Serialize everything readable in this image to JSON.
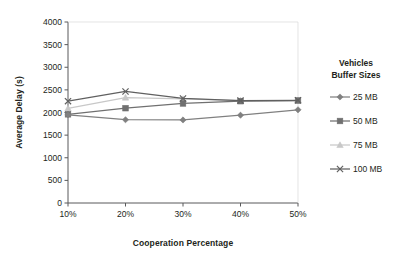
{
  "chart_data": {
    "type": "line",
    "title": "",
    "xlabel": "Cooperation Percentage",
    "ylabel": "Average Delay (s)",
    "categories": [
      "10%",
      "20%",
      "30%",
      "40%",
      "50%"
    ],
    "x_tick_labels": [
      "10%",
      "20%",
      "30%",
      "40%",
      "50%"
    ],
    "y_tick_labels": [
      "0",
      "500",
      "1000",
      "1500",
      "2000",
      "2500",
      "3000",
      "3500",
      "4000"
    ],
    "y_ticks": [
      0,
      500,
      1000,
      1500,
      2000,
      2500,
      3000,
      3500,
      4000
    ],
    "ylim": [
      0,
      4000
    ],
    "xlim": [
      0,
      4
    ],
    "grid": false,
    "legend_position": "right",
    "legend_title_line1": "Vehicles",
    "legend_title_line2": "Buffer Sizes",
    "series": [
      {
        "name": "25 MB",
        "marker": "diamond",
        "color": "#808080",
        "values": [
          1950,
          1840,
          1835,
          1940,
          2060
        ]
      },
      {
        "name": "50 MB",
        "marker": "square",
        "color": "#707070",
        "values": [
          1960,
          2095,
          2200,
          2250,
          2265
        ]
      },
      {
        "name": "75 MB",
        "marker": "triangle",
        "color": "#c8c8c8",
        "values": [
          2090,
          2330,
          2300,
          2265,
          2265
        ]
      },
      {
        "name": "100 MB",
        "marker": "x",
        "color": "#606060",
        "values": [
          2250,
          2465,
          2310,
          2265,
          2270
        ]
      }
    ]
  },
  "colors": {
    "axis": "#58595b",
    "text": "#231f20",
    "background": "#ffffff"
  }
}
